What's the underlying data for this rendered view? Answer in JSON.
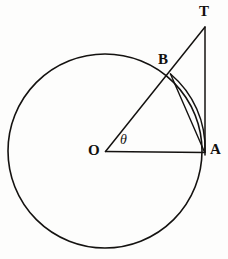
{
  "figure": {
    "background_color": "#fdfdfc",
    "ink_color": "#141210",
    "labels": {
      "center": "O",
      "tangent_point": "A",
      "arc_point": "B",
      "tangent_apex": "T",
      "angle": "θ"
    },
    "geometry": {
      "circle": {
        "cx": 105,
        "cy": 151,
        "r": 97,
        "stroke_width": 1.5
      },
      "points": {
        "O": {
          "x": 105,
          "y": 151
        },
        "A": {
          "x": 205,
          "y": 152
        },
        "B": {
          "x": 170.5,
          "y": 74
        },
        "T": {
          "x": 205,
          "y": 27
        }
      },
      "segments": [
        {
          "name": "radius-OA",
          "from": "O",
          "to": "A"
        },
        {
          "name": "ray-OT-through-B",
          "from": "O",
          "to": "T"
        },
        {
          "name": "tangent-TA",
          "from": "T",
          "to": "A"
        },
        {
          "name": "chord-BA",
          "from": "B",
          "to": "A"
        }
      ],
      "arc": {
        "name": "arc-BA",
        "from": "B",
        "to": "A",
        "sweep": "clockwise-minor"
      }
    }
  }
}
